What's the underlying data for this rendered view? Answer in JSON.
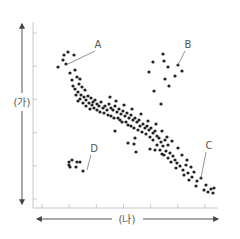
{
  "chart_data": {
    "type": "scatter",
    "title": "",
    "xlabel": "(나)",
    "ylabel": "(가)",
    "grid": false,
    "legend": null,
    "axes": {
      "x_ticks_count": 7,
      "y_ticks_count": 6,
      "tick_labels_shown": false,
      "x_arrow": "double-headed",
      "y_arrow": "double-headed"
    },
    "colors": {
      "points": "#222222",
      "axis": "#bbbbbb",
      "arrow": "#555555",
      "label": "#666666"
    },
    "annotations": [
      {
        "text": "A",
        "label_xy": [
          98,
          48
        ],
        "target_xy": [
          66,
          65
        ]
      },
      {
        "text": "B",
        "label_xy": [
          188,
          48
        ],
        "target_xy": [
          178,
          65
        ]
      },
      {
        "text": "C",
        "label_xy": [
          209,
          149
        ],
        "target_xy": [
          201,
          178
        ]
      },
      {
        "text": "D",
        "label_xy": [
          94,
          152
        ],
        "target_xy": [
          87,
          170
        ]
      }
    ],
    "series": [
      {
        "name": "main-trend",
        "description": "dense negatively-correlated band from upper-left to lower-right",
        "points": [
          [
            58,
            67
          ],
          [
            64,
            55
          ],
          [
            68,
            52
          ],
          [
            63,
            60
          ],
          [
            74,
            55
          ],
          [
            66,
            64
          ],
          [
            70,
            73
          ],
          [
            75,
            70
          ],
          [
            77,
            77
          ],
          [
            72,
            80
          ],
          [
            80,
            79
          ],
          [
            79,
            84
          ],
          [
            73,
            86
          ],
          [
            75,
            89
          ],
          [
            82,
            87
          ],
          [
            85,
            90
          ],
          [
            78,
            92
          ],
          [
            76,
            95
          ],
          [
            81,
            95
          ],
          [
            84,
            97
          ],
          [
            88,
            96
          ],
          [
            91,
            98
          ],
          [
            86,
            100
          ],
          [
            80,
            99
          ],
          [
            78,
            101
          ],
          [
            83,
            103
          ],
          [
            89,
            103
          ],
          [
            93,
            102
          ],
          [
            95,
            100
          ],
          [
            92,
            105
          ],
          [
            86,
            106
          ],
          [
            97,
            104
          ],
          [
            99,
            106
          ],
          [
            94,
            108
          ],
          [
            90,
            109
          ],
          [
            101,
            102
          ],
          [
            103,
            108
          ],
          [
            97,
            110
          ],
          [
            105,
            106
          ],
          [
            107,
            110
          ],
          [
            100,
            112
          ],
          [
            109,
            104
          ],
          [
            111,
            108
          ],
          [
            104,
            113
          ],
          [
            113,
            110
          ],
          [
            108,
            115
          ],
          [
            115,
            106
          ],
          [
            117,
            112
          ],
          [
            111,
            116
          ],
          [
            119,
            109
          ],
          [
            121,
            114
          ],
          [
            114,
            118
          ],
          [
            118,
            118
          ],
          [
            123,
            111
          ],
          [
            125,
            116
          ],
          [
            120,
            120
          ],
          [
            127,
            113
          ],
          [
            129,
            118
          ],
          [
            122,
            122
          ],
          [
            126,
            122
          ],
          [
            131,
            115
          ],
          [
            133,
            120
          ],
          [
            128,
            125
          ],
          [
            135,
            118
          ],
          [
            137,
            122
          ],
          [
            131,
            126
          ],
          [
            139,
            120
          ],
          [
            140,
            126
          ],
          [
            134,
            128
          ],
          [
            143,
            124
          ],
          [
            145,
            128
          ],
          [
            138,
            130
          ],
          [
            142,
            132
          ],
          [
            147,
            126
          ],
          [
            149,
            130
          ],
          [
            146,
            134
          ],
          [
            151,
            128
          ],
          [
            153,
            133
          ],
          [
            150,
            137
          ],
          [
            155,
            131
          ],
          [
            157,
            136
          ],
          [
            153,
            140
          ],
          [
            159,
            138
          ],
          [
            161,
            142
          ],
          [
            157,
            145
          ],
          [
            163,
            146
          ],
          [
            165,
            140
          ],
          [
            160,
            150
          ],
          [
            166,
            151
          ],
          [
            168,
            145
          ],
          [
            164,
            155
          ],
          [
            170,
            153
          ],
          [
            168,
            158
          ],
          [
            173,
            156
          ],
          [
            175,
            160
          ],
          [
            171,
            162
          ],
          [
            177,
            163
          ],
          [
            180,
            166
          ],
          [
            176,
            168
          ],
          [
            183,
            170
          ],
          [
            186,
            165
          ],
          [
            188,
            173
          ],
          [
            184,
            175
          ],
          [
            192,
            177
          ],
          [
            189,
            180
          ],
          [
            197,
            181
          ],
          [
            201,
            178
          ],
          [
            196,
            186
          ],
          [
            206,
            185
          ],
          [
            211,
            189
          ],
          [
            204,
            190
          ],
          [
            214,
            188
          ],
          [
            208,
            192
          ],
          [
            213,
            193
          ],
          [
            110,
            97
          ],
          [
            116,
            101
          ],
          [
            124,
            105
          ],
          [
            132,
            109
          ],
          [
            141,
            114
          ],
          [
            148,
            121
          ],
          [
            156,
            124
          ],
          [
            162,
            131
          ],
          [
            167,
            137
          ],
          [
            172,
            141
          ],
          [
            178,
            148
          ],
          [
            182,
            155
          ],
          [
            187,
            160
          ],
          [
            191,
            167
          ],
          [
            194,
            172
          ]
        ]
      },
      {
        "name": "cluster-B",
        "points": [
          [
            163,
            54
          ],
          [
            153,
            62
          ],
          [
            164,
            61
          ],
          [
            168,
            67
          ],
          [
            178,
            65
          ],
          [
            149,
            72
          ],
          [
            182,
            71
          ],
          [
            175,
            76
          ],
          [
            165,
            79
          ],
          [
            169,
            86
          ],
          [
            154,
            91
          ],
          [
            161,
            104
          ]
        ]
      },
      {
        "name": "cluster-D",
        "points": [
          [
            72,
            160
          ],
          [
            69,
            162
          ],
          [
            69,
            165
          ],
          [
            77,
            162
          ],
          [
            80,
            162
          ],
          [
            76,
            167
          ],
          [
            70,
            167
          ],
          [
            83,
            171
          ]
        ]
      },
      {
        "name": "scattered-outliers",
        "points": [
          [
            128,
            143
          ],
          [
            136,
            152
          ],
          [
            134,
            144
          ],
          [
            150,
            149
          ],
          [
            155,
            150
          ],
          [
            162,
            154
          ],
          [
            135,
            138
          ],
          [
            115,
            131
          ]
        ]
      }
    ]
  }
}
